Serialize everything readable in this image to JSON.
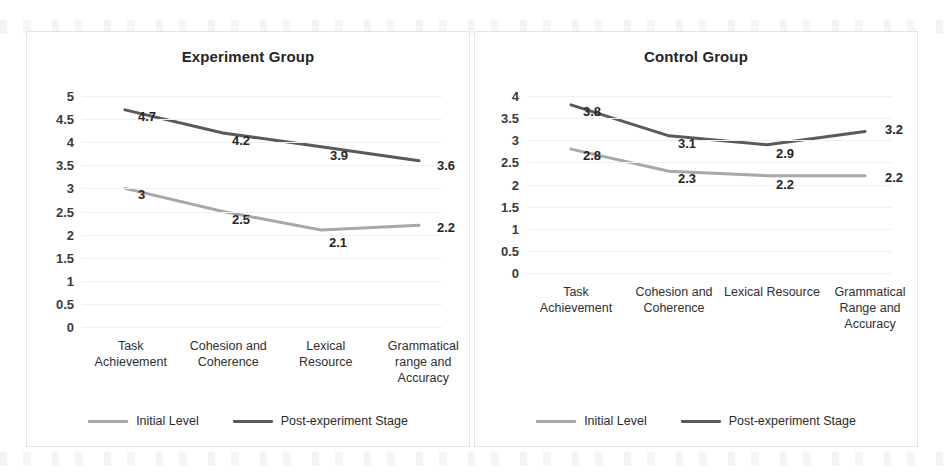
{
  "chart_data": [
    {
      "type": "line",
      "title": "Experiment Group",
      "xlabel": "",
      "ylabel": "",
      "ylim": [
        0,
        5
      ],
      "ytick_labels": [
        "5",
        "4.5",
        "4",
        "3.5",
        "3",
        "2.5",
        "2",
        "1.5",
        "1",
        "0.5",
        "0"
      ],
      "ytick_values": [
        5,
        4.5,
        4,
        3.5,
        3,
        2.5,
        2,
        1.5,
        1,
        0.5,
        0
      ],
      "grid": true,
      "legend_position": "bottom",
      "categories": [
        "Task\nAchievement",
        "Cohesion and\nCoherence",
        "Lexical\nResource",
        "Grammatical\nrange and\nAccuracy"
      ],
      "category_lines": [
        [
          "Task",
          "Achievement"
        ],
        [
          "Cohesion and",
          "Coherence"
        ],
        [
          "Lexical",
          "Resource"
        ],
        [
          "Grammatical",
          "range and",
          "Accuracy"
        ]
      ],
      "series": [
        {
          "name": "Initial Level",
          "color": "#a8a8a8",
          "values": [
            3,
            2.5,
            2.1,
            2.2
          ],
          "data_labels": [
            "3",
            "2.5",
            "2.1",
            "2.2"
          ]
        },
        {
          "name": "Post-experiment Stage",
          "color": "#5a5a5a",
          "values": [
            4.7,
            4.2,
            3.9,
            3.6
          ],
          "data_labels": [
            "4.7",
            "4.2",
            "3.9",
            "3.6"
          ]
        }
      ]
    },
    {
      "type": "line",
      "title": "Control Group",
      "xlabel": "",
      "ylabel": "",
      "ylim": [
        0,
        4
      ],
      "ytick_labels": [
        "4",
        "3.5",
        "3",
        "2.5",
        "2",
        "1.5",
        "1",
        "0.5",
        "0"
      ],
      "ytick_values": [
        4,
        3.5,
        3,
        2.5,
        2,
        1.5,
        1,
        0.5,
        0
      ],
      "grid": true,
      "legend_position": "bottom",
      "categories": [
        "Task\nAchievement",
        "Cohesion and\nCoherence",
        "Lexical Resource",
        "Grammatical\nRange and\nAccuracy"
      ],
      "category_lines": [
        [
          "Task",
          "Achievement"
        ],
        [
          "Cohesion and",
          "Coherence"
        ],
        [
          "Lexical Resource"
        ],
        [
          "Grammatical",
          "Range and",
          "Accuracy"
        ]
      ],
      "series": [
        {
          "name": "Initial Level",
          "color": "#a8a8a8",
          "values": [
            2.8,
            2.3,
            2.2,
            2.2
          ],
          "data_labels": [
            "2.8",
            "2.3",
            "2.2",
            "2.2"
          ]
        },
        {
          "name": "Post-experiment Stage",
          "color": "#5a5a5a",
          "values": [
            3.8,
            3.1,
            2.9,
            3.2
          ],
          "data_labels": [
            "3.8",
            "3.1",
            "2.9",
            "3.2"
          ]
        }
      ]
    }
  ],
  "panels": {
    "left": {
      "title": "Experiment Group",
      "legend": {
        "initial_label": "Initial Level",
        "post_label": "Post-experiment Stage"
      }
    },
    "right": {
      "title": "Control Group",
      "legend": {
        "initial_label": "Initial Level",
        "post_label": "Post-experiment Stage"
      }
    }
  },
  "colors": {
    "initial_level": "#a8a8a8",
    "post_experiment": "#5a5a5a",
    "gridline": "#f0f0f0",
    "text": "#2b2b2b",
    "panel_border": "#e3e3e3"
  }
}
